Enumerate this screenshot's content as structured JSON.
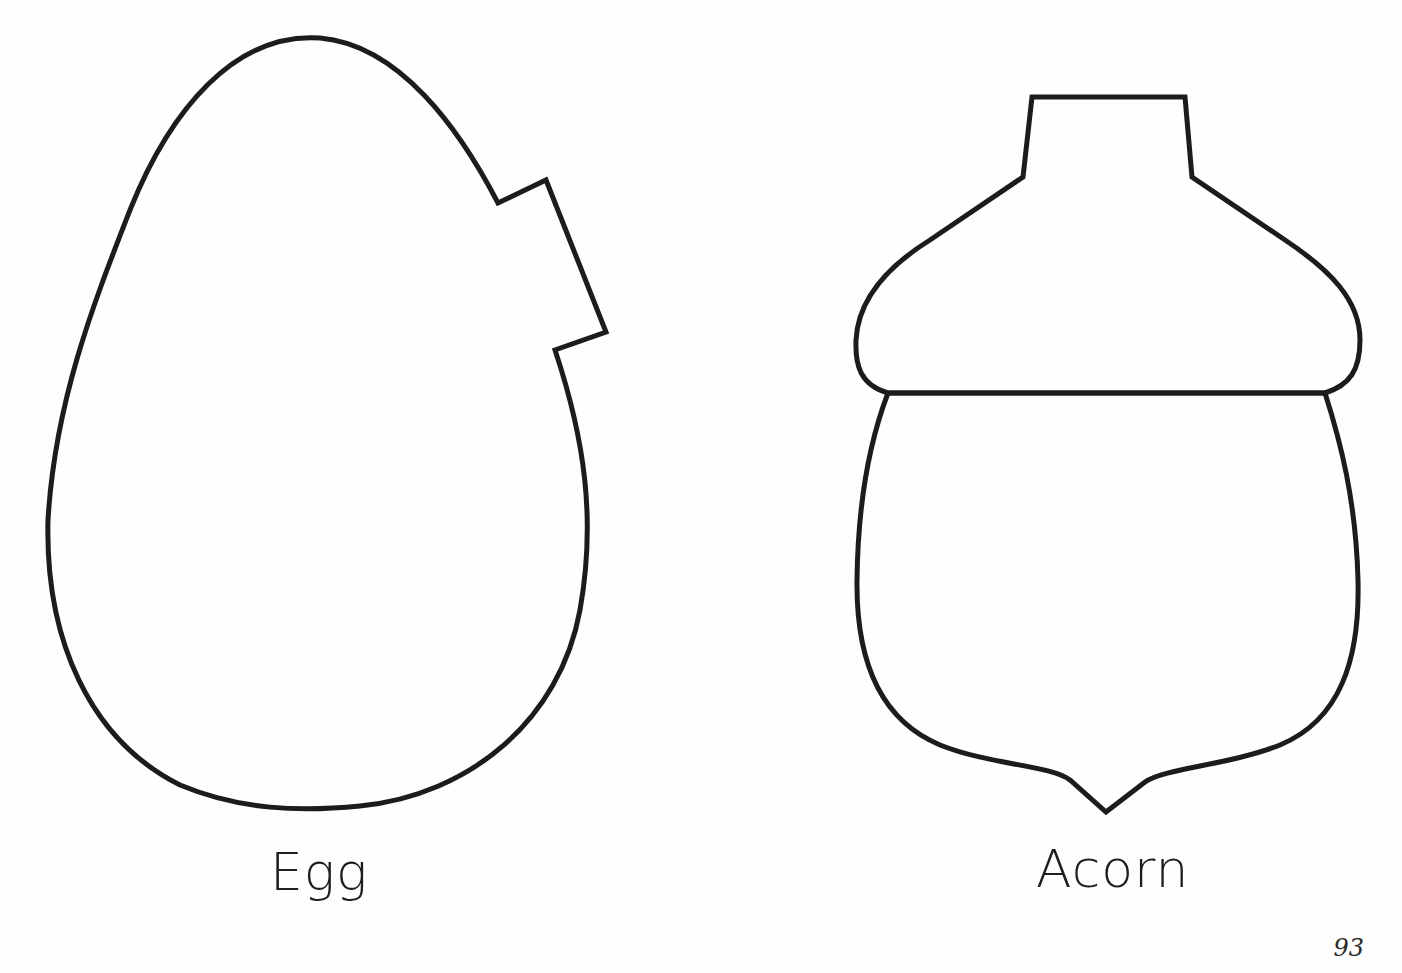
{
  "page": {
    "number": "93",
    "background": "#ffffff",
    "stroke_color": "#1c1c1c"
  },
  "templates": [
    {
      "id": "egg",
      "label": "Egg",
      "shape": "egg-outline-with-notch"
    },
    {
      "id": "acorn",
      "label": "Acorn",
      "shape": "acorn-outline-cap-and-nut"
    }
  ]
}
